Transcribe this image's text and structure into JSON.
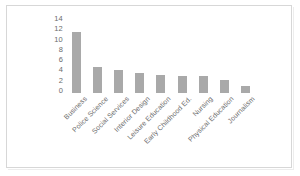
{
  "chart_data": {
    "type": "bar",
    "title": "",
    "xlabel": "",
    "ylabel": "",
    "categories": [
      "Business",
      "Police Science",
      "Social Services",
      "Interior Design",
      "Leisure Education",
      "Early Childhood Ed.",
      "Nursing",
      "Physical Education",
      "Journalism"
    ],
    "values": [
      11.8,
      5.0,
      4.4,
      3.9,
      3.5,
      3.4,
      3.3,
      2.6,
      1.4
    ],
    "ylim": [
      0,
      14
    ],
    "yticks": [
      "0",
      "2",
      "4",
      "6",
      "8",
      "10",
      "12",
      "14"
    ],
    "ytick_values": [
      0,
      2,
      4,
      6,
      8,
      10,
      12,
      14
    ],
    "grid": false,
    "legend": false,
    "bar_color": "#a9a9a9",
    "axis_text_color": "#6b6b6b",
    "background_color": "#ffffff",
    "border_color": "#d7d7d7"
  }
}
